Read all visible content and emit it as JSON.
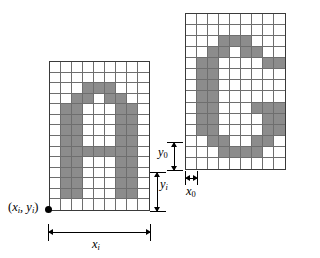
{
  "figure": {
    "colors": {
      "pixel_on": "#8c8c8c",
      "pixel_off": "#ffffff",
      "grid_line": "#6e6e6e",
      "border": "#3a3a3a",
      "annotation": "#000000"
    }
  },
  "grids": [
    {
      "name": "left-character-grid",
      "glyph": "A",
      "cols": 9,
      "rows": 14,
      "pixels": [
        [
          0,
          0,
          0,
          0,
          0,
          0,
          0,
          0,
          0
        ],
        [
          0,
          0,
          0,
          0,
          0,
          0,
          0,
          0,
          0
        ],
        [
          0,
          0,
          0,
          1,
          1,
          1,
          0,
          0,
          0
        ],
        [
          0,
          0,
          1,
          1,
          0,
          1,
          1,
          0,
          0
        ],
        [
          0,
          1,
          1,
          0,
          0,
          0,
          1,
          1,
          0
        ],
        [
          0,
          1,
          1,
          0,
          0,
          0,
          1,
          1,
          0
        ],
        [
          0,
          1,
          1,
          0,
          0,
          0,
          1,
          1,
          0
        ],
        [
          0,
          1,
          1,
          0,
          0,
          0,
          1,
          1,
          0
        ],
        [
          0,
          1,
          1,
          1,
          1,
          1,
          1,
          1,
          0
        ],
        [
          0,
          1,
          1,
          0,
          0,
          0,
          1,
          1,
          0
        ],
        [
          0,
          1,
          1,
          0,
          0,
          0,
          1,
          1,
          0
        ],
        [
          0,
          1,
          1,
          0,
          0,
          0,
          1,
          1,
          0
        ],
        [
          0,
          1,
          1,
          0,
          0,
          0,
          1,
          1,
          0
        ],
        [
          0,
          0,
          0,
          0,
          0,
          0,
          0,
          0,
          0
        ]
      ]
    },
    {
      "name": "right-character-grid",
      "glyph": "G",
      "cols": 9,
      "rows": 14,
      "pixels": [
        [
          0,
          0,
          0,
          0,
          0,
          0,
          0,
          0,
          0
        ],
        [
          0,
          0,
          0,
          0,
          0,
          0,
          0,
          0,
          0
        ],
        [
          0,
          0,
          0,
          1,
          1,
          1,
          0,
          0,
          0
        ],
        [
          0,
          0,
          1,
          1,
          0,
          1,
          1,
          0,
          0
        ],
        [
          0,
          1,
          1,
          0,
          0,
          0,
          0,
          1,
          1
        ],
        [
          0,
          1,
          1,
          0,
          0,
          0,
          0,
          0,
          0
        ],
        [
          0,
          1,
          1,
          0,
          0,
          0,
          0,
          0,
          0
        ],
        [
          0,
          1,
          1,
          0,
          0,
          0,
          0,
          0,
          0
        ],
        [
          0,
          1,
          1,
          0,
          0,
          0,
          1,
          1,
          1
        ],
        [
          0,
          1,
          1,
          0,
          0,
          0,
          0,
          1,
          1
        ],
        [
          0,
          1,
          1,
          0,
          0,
          0,
          0,
          1,
          1
        ],
        [
          0,
          0,
          1,
          1,
          0,
          0,
          1,
          1,
          0
        ],
        [
          0,
          0,
          0,
          1,
          1,
          1,
          1,
          0,
          0
        ],
        [
          0,
          0,
          0,
          0,
          0,
          0,
          0,
          0,
          0
        ]
      ]
    }
  ],
  "labels": {
    "origin": {
      "open_paren": "(",
      "x_var": "x",
      "x_sub": "i",
      "comma": ", ",
      "y_var": "y",
      "y_sub": "i",
      "close_paren": ")",
      "full_text": "(x i , y i )"
    },
    "xi": {
      "var": "x",
      "sub": "i"
    },
    "yi": {
      "var": "y",
      "sub": "i"
    },
    "x0": {
      "var": "x",
      "sub": "0"
    },
    "y0": {
      "var": "y",
      "sub": "0"
    }
  }
}
